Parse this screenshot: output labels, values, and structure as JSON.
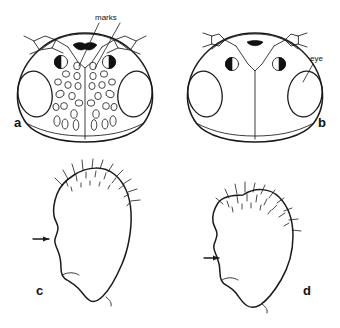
{
  "figure": {
    "background_color": "#ffffff",
    "ink_color": "#1a1a1a",
    "eye_fill_pattern": "stipple-crosshatch",
    "panels": [
      {
        "id": "a",
        "letter": "a",
        "letter_x": 14,
        "letter_y": 127,
        "subject": "head-frontal-view-with-pale-markings",
        "has_ocelli": true,
        "has_antennal_bases": true,
        "has_pale_spots": true
      },
      {
        "id": "b",
        "letter": "b",
        "letter_x": 318,
        "letter_y": 127,
        "subject": "head-frontal-view-plain",
        "has_ocelli": true,
        "has_antennal_bases": true,
        "has_pale_spots": false
      },
      {
        "id": "c",
        "letter": "c",
        "letter_x": 36,
        "letter_y": 295,
        "subject": "lateral-outline-with-setae",
        "has_arrow": true,
        "has_setae": true
      },
      {
        "id": "d",
        "letter": "d",
        "letter_x": 303,
        "letter_y": 295,
        "subject": "lateral-outline-with-setae",
        "has_arrow": true,
        "has_setae": true
      }
    ],
    "annotations": [
      {
        "id": "marks",
        "text": "marks",
        "text_x": 95,
        "text_y": 20,
        "font_size": 8,
        "leaders": 2,
        "target_panel": "a"
      },
      {
        "id": "eye",
        "text": "eye",
        "text_x": 310,
        "text_y": 61,
        "font_size": 8,
        "leaders": 1,
        "target_panel": "b"
      }
    ]
  }
}
